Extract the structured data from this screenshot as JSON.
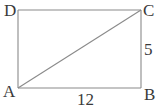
{
  "diagram": {
    "type": "rectangle-with-diagonal",
    "vertices": {
      "A": {
        "label": "A",
        "x": 18,
        "y": 88
      },
      "B": {
        "label": "B",
        "x": 141,
        "y": 88
      },
      "C": {
        "label": "C",
        "x": 141,
        "y": 10
      },
      "D": {
        "label": "D",
        "x": 18,
        "y": 10
      }
    },
    "segments": [
      {
        "from": "A",
        "to": "B",
        "label": "12"
      },
      {
        "from": "B",
        "to": "C",
        "label": "5"
      },
      {
        "from": "C",
        "to": "D",
        "label": ""
      },
      {
        "from": "D",
        "to": "A",
        "label": ""
      },
      {
        "from": "A",
        "to": "C",
        "label": ""
      }
    ],
    "labels": {
      "A": "A",
      "B": "B",
      "C": "C",
      "D": "D",
      "AB": "12",
      "BC": "5"
    },
    "colors": {
      "line": "#8a8a8a",
      "text": "#3a3a3a",
      "background": "#ffffff"
    }
  }
}
